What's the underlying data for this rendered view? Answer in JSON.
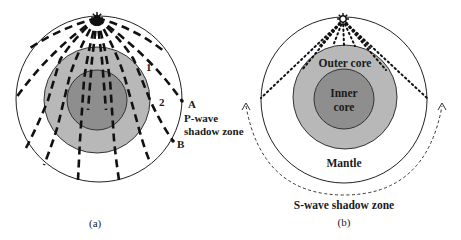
{
  "colors": {
    "outer_core": "#b8b8b8",
    "inner_core": "#8e8e8e",
    "line": "#111111",
    "background": "#ffffff"
  },
  "panel_a": {
    "caption": "(a)",
    "labels": {
      "ray_1": "1",
      "ray_2": "2",
      "point_a": "A",
      "point_b": "B",
      "shadow_line1": "P-wave",
      "shadow_line2": "shadow zone"
    },
    "icon": "earthquake-focus-star"
  },
  "panel_b": {
    "caption": "(b)",
    "labels": {
      "outer_core": "Outer core",
      "inner_core_line1": "Inner",
      "inner_core_line2": "core",
      "mantle": "Mantle",
      "shadow_zone": "S-wave shadow zone"
    },
    "icon": "earthquake-focus-star"
  }
}
